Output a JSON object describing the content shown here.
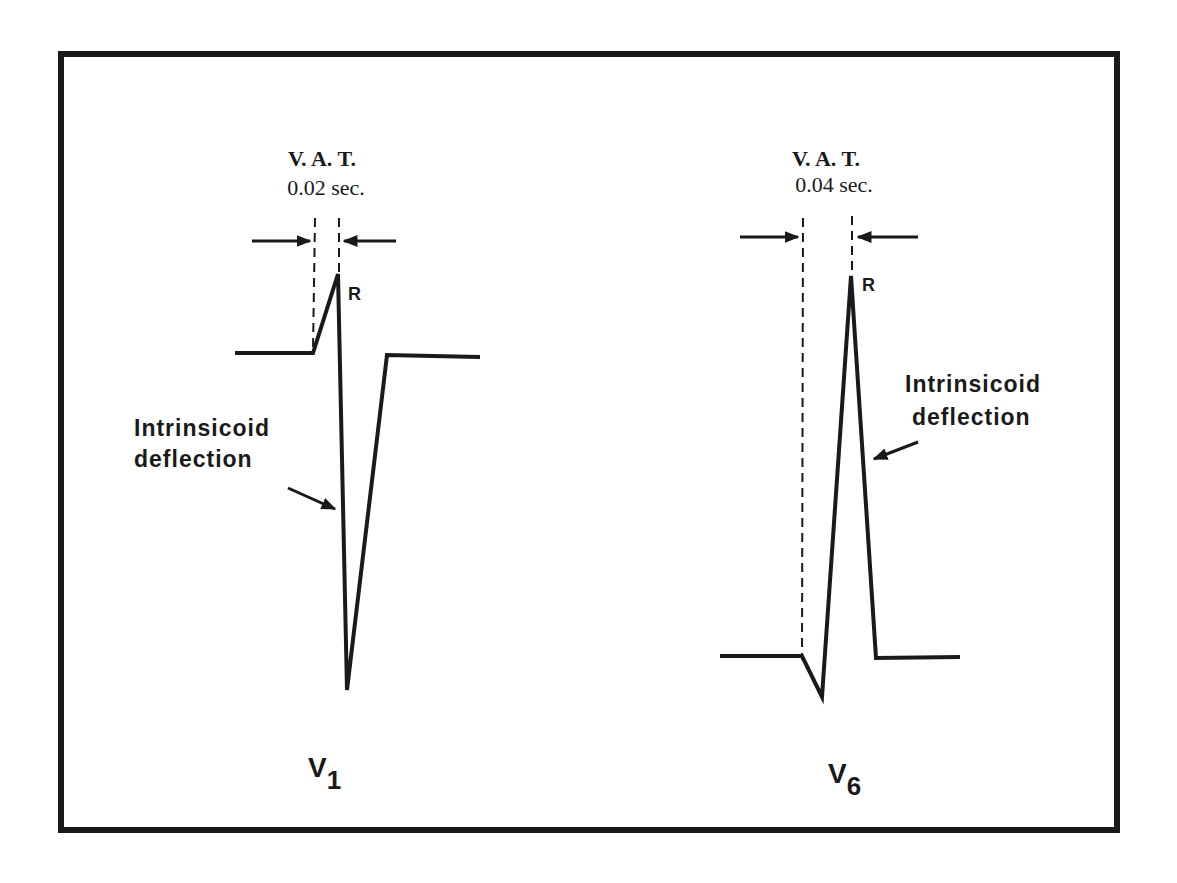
{
  "diagram": {
    "colors": {
      "ink": "#1a1a1a",
      "background": "#ffffff"
    },
    "leads": [
      {
        "name": "V",
        "subscript": "1",
        "vat_title": "V. A. T.",
        "vat_value": "0.02 sec.",
        "peak_label": "R",
        "annotation_line1": "Intrinsicoid",
        "annotation_line2": "deflection"
      },
      {
        "name": "V",
        "subscript": "6",
        "vat_title": "V. A. T.",
        "vat_value": "0.04 sec.",
        "peak_label": "R",
        "annotation_line1": "Intrinsicoid",
        "annotation_line2": "deflection"
      }
    ]
  }
}
